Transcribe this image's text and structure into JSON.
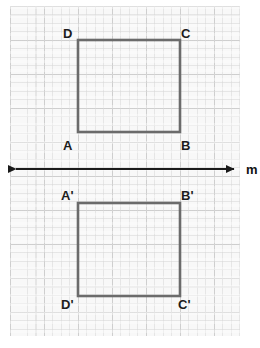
{
  "figure": {
    "background_color": "#f8f8f8",
    "grid_major_color": "#c4c4c4",
    "grid_minor_color": "#d7d7d7",
    "shape_stroke_color": "#6b6b6b",
    "line_color": "#1a1a1a",
    "label_color": "#1c1c1c"
  },
  "line_of_reflection": {
    "name": "m",
    "label": "m",
    "y": 169,
    "x_start": 8,
    "x_end": 242,
    "arrow_left": true,
    "arrow_right": true
  },
  "preimage": {
    "name": "ABCD",
    "x_left": 78,
    "x_right": 180,
    "y_top": 40,
    "y_bottom": 132,
    "vertices": [
      {
        "id": "D",
        "label": "D",
        "x": 78,
        "y": 40,
        "label_x": 63,
        "label_y": 27
      },
      {
        "id": "C",
        "label": "C",
        "x": 180,
        "y": 40,
        "label_x": 181,
        "label_y": 27
      },
      {
        "id": "A",
        "label": "A",
        "x": 78,
        "y": 132,
        "label_x": 63,
        "label_y": 139
      },
      {
        "id": "B",
        "label": "B",
        "x": 180,
        "y": 132,
        "label_x": 181,
        "label_y": 139
      }
    ]
  },
  "image": {
    "name": "A'B'C'D'",
    "x_left": 78,
    "x_right": 180,
    "y_top": 203,
    "y_bottom": 296,
    "vertices": [
      {
        "id": "A'",
        "label": "A'",
        "x": 78,
        "y": 203,
        "label_x": 61,
        "label_y": 189
      },
      {
        "id": "B'",
        "label": "B'",
        "x": 180,
        "y": 203,
        "label_x": 181,
        "label_y": 189
      },
      {
        "id": "D'",
        "label": "D'",
        "x": 78,
        "y": 296,
        "label_x": 61,
        "label_y": 298
      },
      {
        "id": "C'",
        "label": "C'",
        "x": 180,
        "y": 296,
        "label_x": 178,
        "label_y": 298
      }
    ]
  }
}
